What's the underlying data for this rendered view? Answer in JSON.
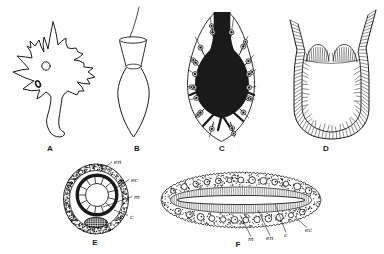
{
  "figure": {
    "panels": [
      {
        "letter": "A"
      },
      {
        "letter": "B"
      },
      {
        "letter": "C"
      },
      {
        "letter": "D"
      },
      {
        "letter": "E"
      },
      {
        "letter": "F"
      }
    ],
    "e_labels": [
      "en",
      "ec",
      "m",
      "c"
    ],
    "f_labels": [
      "m",
      "en",
      "c",
      "ec"
    ],
    "colors": {
      "ink": "#1a1a1a",
      "paper": "#ffffff"
    }
  }
}
